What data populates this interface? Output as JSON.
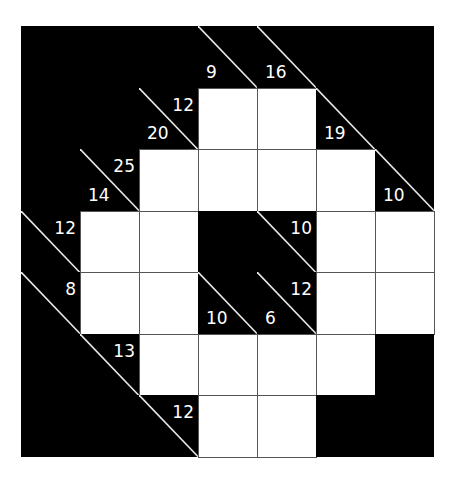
{
  "puzzle": {
    "type": "kakuro",
    "rows": 7,
    "cols": 7,
    "colors": {
      "block": "#000000",
      "entry": "#ffffff",
      "clue_text": "#ffffff",
      "grid_line": "#555555"
    },
    "cells": [
      [
        {
          "t": "b"
        },
        {
          "t": "b"
        },
        {
          "t": "b"
        },
        {
          "t": "c",
          "down": "9"
        },
        {
          "t": "c",
          "down": "16"
        },
        {
          "t": "b"
        },
        {
          "t": "b"
        }
      ],
      [
        {
          "t": "b"
        },
        {
          "t": "b"
        },
        {
          "t": "c",
          "across": "12",
          "down": "20"
        },
        {
          "t": "w"
        },
        {
          "t": "w"
        },
        {
          "t": "c",
          "down": "19"
        },
        {
          "t": "b"
        }
      ],
      [
        {
          "t": "b"
        },
        {
          "t": "c",
          "across": "25",
          "down": "14"
        },
        {
          "t": "w"
        },
        {
          "t": "w"
        },
        {
          "t": "w"
        },
        {
          "t": "w"
        },
        {
          "t": "c",
          "down": "10"
        }
      ],
      [
        {
          "t": "c",
          "across": "12"
        },
        {
          "t": "w"
        },
        {
          "t": "w"
        },
        {
          "t": "b"
        },
        {
          "t": "c",
          "across": "10"
        },
        {
          "t": "w"
        },
        {
          "t": "w"
        }
      ],
      [
        {
          "t": "c",
          "across": "8"
        },
        {
          "t": "w"
        },
        {
          "t": "w"
        },
        {
          "t": "c",
          "down": "10"
        },
        {
          "t": "c",
          "across": "12",
          "down": "6"
        },
        {
          "t": "w"
        },
        {
          "t": "w"
        }
      ],
      [
        {
          "t": "b"
        },
        {
          "t": "c",
          "across": "13"
        },
        {
          "t": "w"
        },
        {
          "t": "w"
        },
        {
          "t": "w"
        },
        {
          "t": "w"
        },
        {
          "t": "b"
        }
      ],
      [
        {
          "t": "b"
        },
        {
          "t": "b"
        },
        {
          "t": "c",
          "across": "12"
        },
        {
          "t": "w"
        },
        {
          "t": "w"
        },
        {
          "t": "b"
        },
        {
          "t": "b"
        }
      ]
    ]
  }
}
